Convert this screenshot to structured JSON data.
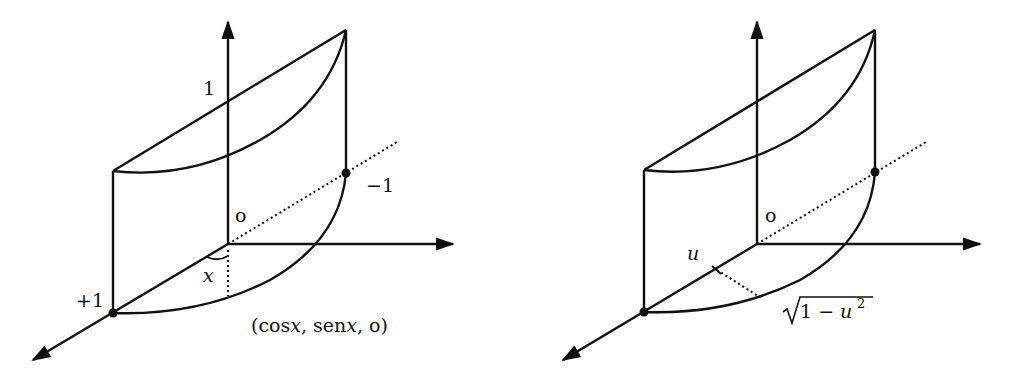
{
  "figures": [
    {
      "id": "left",
      "labels": {
        "z_tick": "1",
        "origin": "o",
        "point_minus": "−1",
        "point_plus": "+1",
        "angle": "x",
        "point_coord_open": "(cos",
        "point_coord_x1": "x",
        "point_coord_mid": ", sen",
        "point_coord_x2": "x",
        "point_coord_close": ", o)"
      }
    },
    {
      "id": "right",
      "labels": {
        "origin": "o",
        "u_label": "u",
        "sqrt_expr": "1 − u",
        "sqrt_exp": "2"
      }
    }
  ],
  "colors": {
    "stroke": "#111111",
    "background": "#ffffff"
  }
}
